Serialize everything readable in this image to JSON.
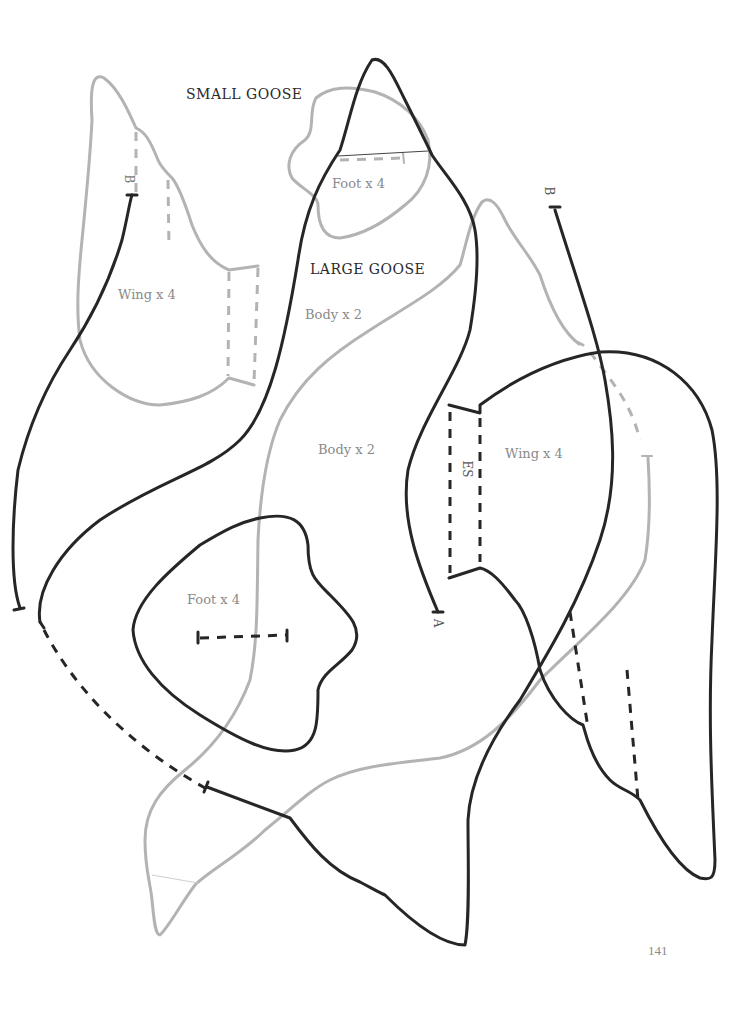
{
  "page": {
    "page_number": "141",
    "background": "#ffffff"
  },
  "colors": {
    "large_goose_outline": "#262626",
    "small_goose_outline": "#b3b3b3",
    "heading_text": "#2a2a2a",
    "piece_label_text": "#8a8a8a"
  },
  "headings": {
    "small_goose": "SMALL GOOSE",
    "large_goose": "LARGE GOOSE"
  },
  "small_goose": {
    "wing_label": "Wing x 4",
    "foot_label": "Foot x 4",
    "body_label": "Body x 2",
    "mark_b": "B"
  },
  "large_goose": {
    "wing_label": "Wing x 4",
    "foot_label": "Foot x 4",
    "body_label": "Body x 2",
    "mark_a": "A",
    "mark_b": "B",
    "mark_es": "ES"
  }
}
